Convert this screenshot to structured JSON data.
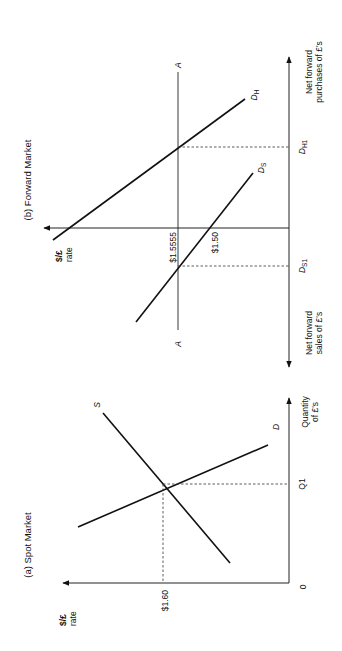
{
  "figure": {
    "orientation": "rotated 90 degrees counter-clockwise",
    "panels": [
      {
        "id": "spot",
        "title": "(a) Spot Market",
        "y_axis_label_line1": "$/£",
        "y_axis_label_line2": "rate",
        "x_axis_label_line1": "Quantity",
        "x_axis_label_line2": "of £'s",
        "origin_label": "0",
        "price_label": "$1.60",
        "quantity_label": "Q1",
        "curves": [
          {
            "name": "S",
            "label": "S"
          },
          {
            "name": "D",
            "label": "D"
          }
        ]
      },
      {
        "id": "forward",
        "title": "(b) Forward Market",
        "y_axis_label_line1": "$/£",
        "y_axis_label_line2": "rate",
        "x_axis_positive_line1": "Net forward",
        "x_axis_positive_line2": "purchases of £'s",
        "x_axis_negative_line1": "Net forward",
        "x_axis_negative_line2": "sales of £'s",
        "price_line_label_top": "A",
        "price_line_label_bottom": "A",
        "price_A_label": "$1.5555",
        "price_intercept_label": "$1.50",
        "curves": [
          {
            "name": "DH",
            "label_main": "D",
            "label_sub": "H",
            "quantity_label_main": "D",
            "quantity_label_sub": "H1"
          },
          {
            "name": "DS",
            "label_main": "D",
            "label_sub": "S",
            "quantity_label_main": "D",
            "quantity_label_sub": "S1"
          }
        ]
      }
    ]
  },
  "colors": {
    "line": "#111111",
    "background": "#ffffff"
  }
}
